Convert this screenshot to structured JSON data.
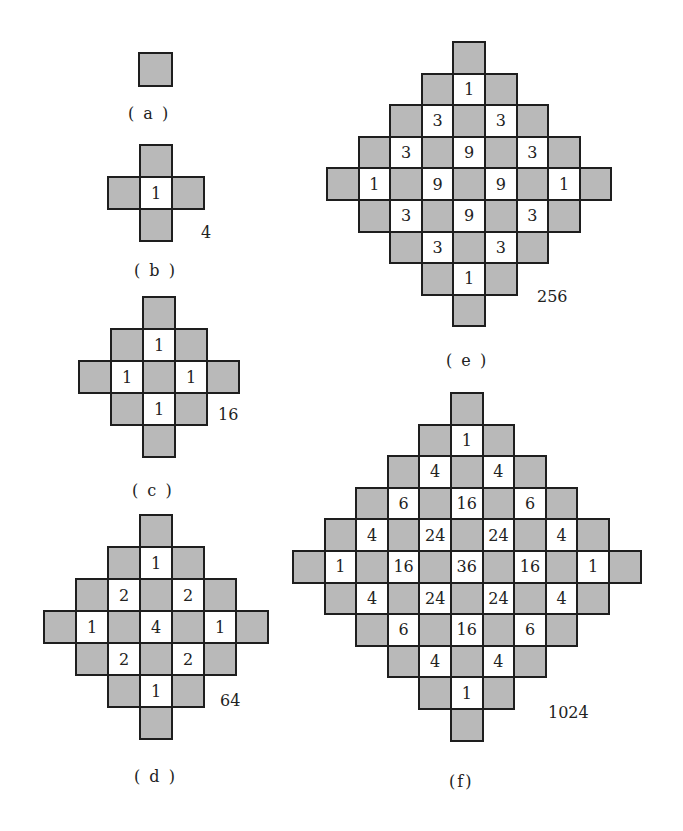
{
  "figures": [
    {
      "id": "a",
      "caption": "( a )",
      "total": "",
      "cell_size": 33,
      "origin": [
        138,
        52
      ],
      "grid": [
        [
          "g"
        ]
      ],
      "total_pos": null,
      "caption_pos": [
        128,
        104
      ]
    },
    {
      "id": "b",
      "caption": "( b )",
      "total": "4",
      "cell_size": 32,
      "origin": [
        107,
        144
      ],
      "grid": [
        [
          null,
          "g",
          null
        ],
        [
          "g",
          "1",
          "g"
        ],
        [
          null,
          "g",
          null
        ]
      ],
      "total_pos": [
        201,
        223
      ],
      "caption_pos": [
        134,
        261
      ]
    },
    {
      "id": "c",
      "caption": "( c )",
      "total": "16",
      "cell_size": 32,
      "origin": [
        78,
        296
      ],
      "grid": [
        [
          null,
          null,
          "g",
          null,
          null
        ],
        [
          null,
          "g",
          "1",
          "g",
          null
        ],
        [
          "g",
          "1",
          "g",
          "1",
          "g"
        ],
        [
          null,
          "g",
          "1",
          "g",
          null
        ],
        [
          null,
          null,
          "g",
          null,
          null
        ]
      ],
      "total_pos": [
        218,
        405
      ],
      "caption_pos": [
        132,
        481
      ]
    },
    {
      "id": "d",
      "caption": "( d )",
      "total": "64",
      "cell_size": 32,
      "origin": [
        43,
        514
      ],
      "grid": [
        [
          null,
          null,
          null,
          "g",
          null,
          null,
          null
        ],
        [
          null,
          null,
          "g",
          "1",
          "g",
          null,
          null
        ],
        [
          null,
          "g",
          "2",
          "g",
          "2",
          "g",
          null
        ],
        [
          "g",
          "1",
          "g",
          "4",
          "g",
          "1",
          "g"
        ],
        [
          null,
          "g",
          "2",
          "g",
          "2",
          "g",
          null
        ],
        [
          null,
          null,
          "g",
          "1",
          "g",
          null,
          null
        ],
        [
          null,
          null,
          null,
          "g",
          null,
          null,
          null
        ]
      ],
      "total_pos": [
        220,
        691
      ],
      "caption_pos": [
        134,
        767
      ]
    },
    {
      "id": "e",
      "caption": "( e )",
      "total": "256",
      "cell_size": 31.6,
      "origin": [
        326,
        41
      ],
      "grid": [
        [
          null,
          null,
          null,
          null,
          "g",
          null,
          null,
          null,
          null
        ],
        [
          null,
          null,
          null,
          "g",
          "1",
          "g",
          null,
          null,
          null
        ],
        [
          null,
          null,
          "g",
          "3",
          "g",
          "3",
          "g",
          null,
          null
        ],
        [
          null,
          "g",
          "3",
          "g",
          "9",
          "g",
          "3",
          "g",
          null
        ],
        [
          "g",
          "1",
          "g",
          "9",
          "g",
          "9",
          "g",
          "1",
          "g"
        ],
        [
          null,
          "g",
          "3",
          "g",
          "9",
          "g",
          "3",
          "g",
          null
        ],
        [
          null,
          null,
          "g",
          "3",
          "g",
          "3",
          "g",
          null,
          null
        ],
        [
          null,
          null,
          null,
          "g",
          "1",
          "g",
          null,
          null,
          null
        ],
        [
          null,
          null,
          null,
          null,
          "g",
          null,
          null,
          null,
          null
        ]
      ],
      "total_pos": [
        537,
        287
      ],
      "caption_pos": [
        446,
        351
      ]
    },
    {
      "id": "f",
      "caption": "(f)",
      "total": "1024",
      "cell_size": 31.6,
      "origin": [
        292,
        392
      ],
      "grid": [
        [
          null,
          null,
          null,
          null,
          null,
          "g",
          null,
          null,
          null,
          null,
          null
        ],
        [
          null,
          null,
          null,
          null,
          "g",
          "1",
          "g",
          null,
          null,
          null,
          null
        ],
        [
          null,
          null,
          null,
          "g",
          "4",
          "g",
          "4",
          "g",
          null,
          null,
          null
        ],
        [
          null,
          null,
          "g",
          "6",
          "g",
          "16",
          "g",
          "6",
          "g",
          null,
          null
        ],
        [
          null,
          "g",
          "4",
          "g",
          "24",
          "g",
          "24",
          "g",
          "4",
          "g",
          null
        ],
        [
          "g",
          "1",
          "g",
          "16",
          "g",
          "36",
          "g",
          "16",
          "g",
          "1",
          "g"
        ],
        [
          null,
          "g",
          "4",
          "g",
          "24",
          "g",
          "24",
          "g",
          "4",
          "g",
          null
        ],
        [
          null,
          null,
          "g",
          "6",
          "g",
          "16",
          "g",
          "6",
          "g",
          null,
          null
        ],
        [
          null,
          null,
          null,
          "g",
          "4",
          "g",
          "4",
          "g",
          null,
          null,
          null
        ],
        [
          null,
          null,
          null,
          null,
          "g",
          "1",
          "g",
          null,
          null,
          null,
          null
        ],
        [
          null,
          null,
          null,
          null,
          null,
          "g",
          null,
          null,
          null,
          null,
          null
        ]
      ],
      "total_pos": [
        548,
        703
      ],
      "caption_pos": [
        449,
        772
      ]
    }
  ],
  "colors": {
    "gray_cell": "#b9b9b9",
    "white_cell": "#ffffff",
    "border": "#1e1e1e",
    "text": "#222222"
  }
}
